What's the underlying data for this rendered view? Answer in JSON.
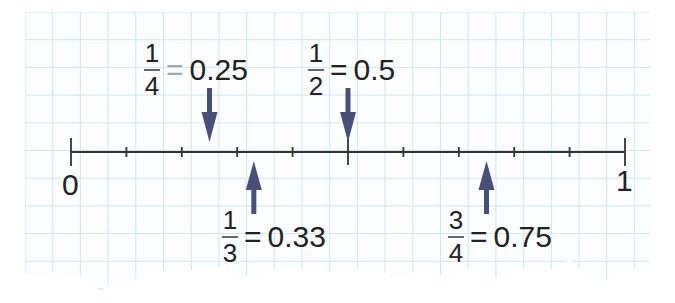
{
  "chart_data": {
    "type": "number_line",
    "title": "",
    "range": [
      0,
      1
    ],
    "tick_step": 0.1,
    "end_labels": [
      "0",
      "1"
    ],
    "markers": [
      {
        "numerator": "1",
        "denominator": "4",
        "decimal": "0.25",
        "value": 0.25,
        "arrow": "down",
        "position": "above"
      },
      {
        "numerator": "1",
        "denominator": "2",
        "decimal": "0.5",
        "value": 0.5,
        "arrow": "down",
        "position": "above"
      },
      {
        "numerator": "1",
        "denominator": "3",
        "decimal": "0.33",
        "value": 0.33,
        "arrow": "up",
        "position": "below"
      },
      {
        "numerator": "3",
        "denominator": "4",
        "decimal": "0.75",
        "value": 0.75,
        "arrow": "up",
        "position": "below"
      }
    ],
    "grid": true
  },
  "colors": {
    "grid": "#cfe6ee",
    "axis": "#333333",
    "arrow": "#4a4f7a",
    "text": "#222222"
  },
  "labels": {
    "zero": "0",
    "one": "1",
    "equals": "=",
    "quarter": {
      "num": "1",
      "den": "4",
      "dec": "0.25"
    },
    "half": {
      "num": "1",
      "den": "2",
      "dec": "0.5"
    },
    "third": {
      "num": "1",
      "den": "3",
      "dec": "0.33"
    },
    "three_quarters": {
      "num": "3",
      "den": "4",
      "dec": "0.75"
    }
  }
}
